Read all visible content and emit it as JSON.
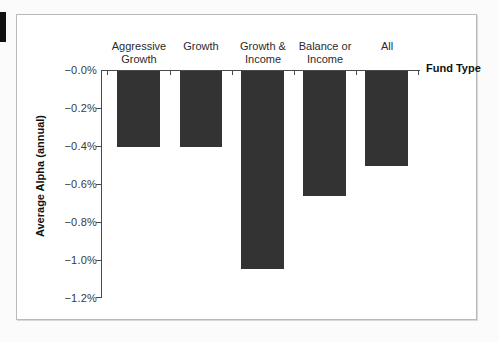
{
  "chart_data": {
    "type": "bar",
    "title": "",
    "subtitle": "",
    "xlabel": "Fund Type",
    "ylabel": "Average Alpha (annual)",
    "categories": [
      "Aggressive Growth",
      "Growth",
      "Growth & Income",
      "Balance or Income",
      "All"
    ],
    "category_labels": [
      "Aggressive\nGrowth",
      "Growth",
      "Growth &\nIncome",
      "Balance or\nIncome",
      "All"
    ],
    "values": [
      -0.4,
      -0.4,
      -1.05,
      -0.66,
      -0.5
    ],
    "value_labels": [
      "-0.40%",
      "-0.40%",
      "-1.05%",
      "-0.66%",
      "-0.50%"
    ],
    "ylim": [
      -1.2,
      0.0
    ],
    "yticks": [
      0.0,
      -0.2,
      -0.4,
      -0.6,
      -0.8,
      -1.0,
      -1.2
    ],
    "ytick_labels": [
      "−0.0%",
      "−0.2%",
      "−0.4%",
      "−0.6%",
      "−0.8%",
      "−1.0%",
      "−1.2%"
    ],
    "grid": false,
    "legend": "none",
    "bar_color": "#333333",
    "axis_color": "#4a4a4a",
    "background": "#ffffff"
  },
  "figure": {
    "frame_color": "#b9b9b9",
    "page_background": "#fbfbfb",
    "edge_tab_color": "#111111"
  }
}
